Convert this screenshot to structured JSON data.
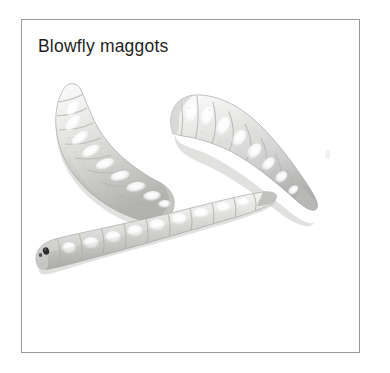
{
  "figure": {
    "caption": "Blowfly maggots",
    "border_color": "#9a9a9a",
    "background_color": "#ffffff",
    "caption_color": "#1f1f1f"
  },
  "photo": {
    "alt_description": "Three pale grey-white segmented blowfly maggots (fly larvae) on a white background",
    "subject_count": 3,
    "body_color": "#d8d8d6",
    "body_highlight_color": "#ffffff",
    "body_shadow_color": "#a9a9a7",
    "mouthhook_color": "#2a2a2a",
    "specimens": [
      {
        "name": "maggot-left",
        "orientation": "curved, head upper-left, tail lower-right",
        "has_visible_mouthhooks": false
      },
      {
        "name": "maggot-right",
        "orientation": "curved, blunt head upper-left, tapered pointed tail lower-right",
        "has_visible_mouthhooks": false
      },
      {
        "name": "maggot-bottom",
        "orientation": "near-horizontal, head left with dark mouth hooks, tapered tail upper-right",
        "has_visible_mouthhooks": true
      }
    ]
  }
}
